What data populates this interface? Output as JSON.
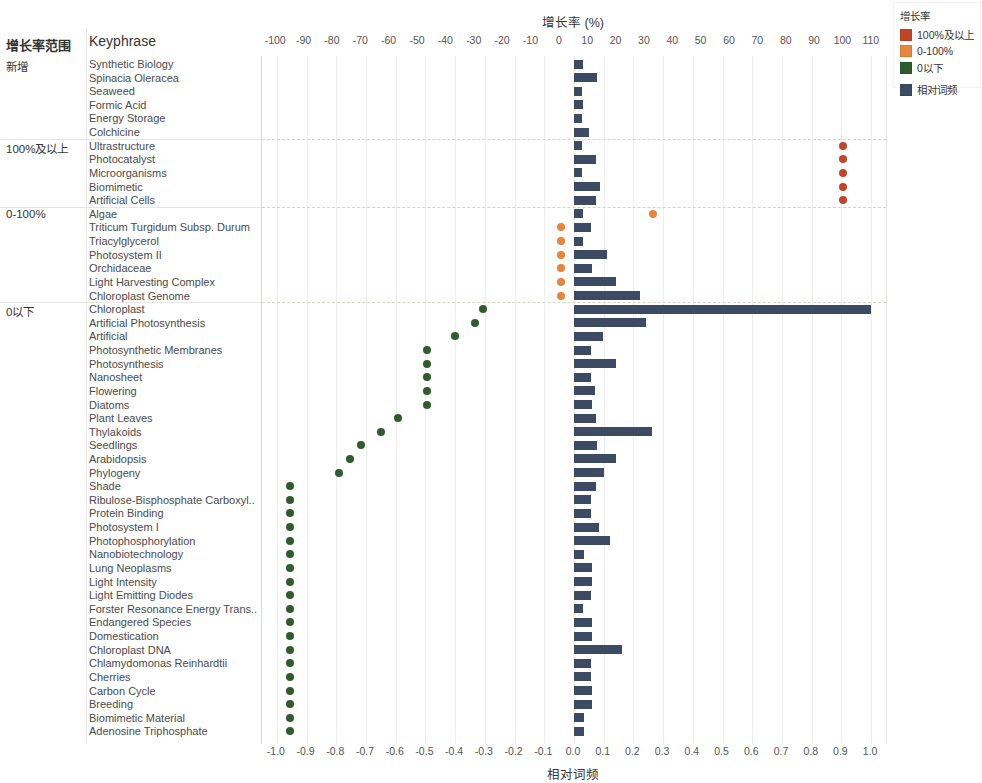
{
  "headers": {
    "range_col": "增长率范围",
    "keyphrase_col": "Keyphrase"
  },
  "legend": {
    "title": "增长率",
    "items": [
      {
        "label": "100%及以上",
        "color": "#c0462a"
      },
      {
        "label": "0-100%",
        "color": "#e8853c"
      },
      {
        "label": "0以下",
        "color": "#2f5c2c"
      },
      {
        "label": "相对词频",
        "color": "#3c4a63"
      }
    ]
  },
  "chart_data": {
    "type": "bar",
    "title": "增长率 (%)",
    "xlabel": "增长率 (%)",
    "xlabel_bottom": "相对词频",
    "ylabel": "Keyphrase",
    "grid": true,
    "legend_position": "top-right",
    "top_axis": {
      "label": "增长率 (%)",
      "ticks": [
        -100,
        -90,
        -80,
        -70,
        -60,
        -50,
        -40,
        -30,
        -20,
        -10,
        0,
        10,
        20,
        30,
        40,
        50,
        60,
        70,
        80,
        90,
        100,
        110
      ],
      "range": [
        -105,
        115
      ]
    },
    "bottom_axis": {
      "label": "相对词频",
      "ticks": [
        "-1.0",
        "-0.9",
        "-0.8",
        "-0.7",
        "-0.6",
        "-0.5",
        "-0.4",
        "-0.3",
        "-0.2",
        "-0.1",
        "0.0",
        "0.1",
        "0.2",
        "0.3",
        "0.4",
        "0.5",
        "0.6",
        "0.7",
        "0.8",
        "0.9",
        "1.0"
      ],
      "range": [
        -1.05,
        1.05
      ]
    },
    "series": [
      {
        "name": "相对词频",
        "type": "bar",
        "color": "#3c4a63"
      },
      {
        "name": "增长率",
        "type": "scatter",
        "colors": {
          "above100": "#c0462a",
          "zero_to_100": "#e8853c",
          "below0": "#2f5c2c"
        }
      }
    ],
    "groups": [
      {
        "label": "新增",
        "category": "new",
        "rows": [
          {
            "keyphrase": "Synthetic Biology",
            "freq": 0.03,
            "growth": null
          },
          {
            "keyphrase": "Spinacia Oleracea",
            "freq": 0.078,
            "growth": null
          },
          {
            "keyphrase": "Seaweed",
            "freq": 0.026,
            "growth": null
          },
          {
            "keyphrase": "Formic Acid",
            "freq": 0.031,
            "growth": null
          },
          {
            "keyphrase": "Energy Storage",
            "freq": 0.027,
            "growth": null
          },
          {
            "keyphrase": "Colchicine",
            "freq": 0.051,
            "growth": null
          }
        ]
      },
      {
        "label": "100%及以上",
        "category": "above100",
        "rows": [
          {
            "keyphrase": "Ultrastructure",
            "freq": 0.028,
            "growth": 100
          },
          {
            "keyphrase": "Photocatalyst",
            "freq": 0.074,
            "growth": 100
          },
          {
            "keyphrase": "Microorganisms",
            "freq": 0.026,
            "growth": 100
          },
          {
            "keyphrase": "Biomimetic",
            "freq": 0.086,
            "growth": 100
          },
          {
            "keyphrase": "Artificial Cells",
            "freq": 0.074,
            "growth": 100
          }
        ]
      },
      {
        "label": "0-100%",
        "category": "zero_to_100",
        "rows": [
          {
            "keyphrase": "Algae",
            "freq": 0.029,
            "growth": 33
          },
          {
            "keyphrase": "Triticum Turgidum Subsp. Durum",
            "freq": 0.057,
            "growth": 0.5
          },
          {
            "keyphrase": "Triacylglycerol",
            "freq": 0.031,
            "growth": 0.5
          },
          {
            "keyphrase": "Photosystem II",
            "freq": 0.111,
            "growth": 0.5
          },
          {
            "keyphrase": "Orchidaceae",
            "freq": 0.061,
            "growth": 0.5
          },
          {
            "keyphrase": "Light Harvesting Complex",
            "freq": 0.143,
            "growth": 0.5
          },
          {
            "keyphrase": "Chloroplast Genome",
            "freq": 0.222,
            "growth": 0.5
          }
        ]
      },
      {
        "label": "0以下",
        "category": "below0",
        "rows": [
          {
            "keyphrase": "Chloroplast",
            "freq": 1.0,
            "growth": -27
          },
          {
            "keyphrase": "Artificial Photosynthesis",
            "freq": 0.243,
            "growth": -30
          },
          {
            "keyphrase": "Artificial",
            "freq": 0.096,
            "growth": -37
          },
          {
            "keyphrase": "Photosynthetic Membranes",
            "freq": 0.058,
            "growth": -47
          },
          {
            "keyphrase": "Photosynthesis",
            "freq": 0.142,
            "growth": -47
          },
          {
            "keyphrase": "Nanosheet",
            "freq": 0.058,
            "growth": -47
          },
          {
            "keyphrase": "Flowering",
            "freq": 0.072,
            "growth": -47
          },
          {
            "keyphrase": "Diatoms",
            "freq": 0.06,
            "growth": -47
          },
          {
            "keyphrase": "Plant Leaves",
            "freq": 0.075,
            "growth": -57
          },
          {
            "keyphrase": "Thylakoids",
            "freq": 0.261,
            "growth": -63
          },
          {
            "keyphrase": "Seedlings",
            "freq": 0.076,
            "growth": -70
          },
          {
            "keyphrase": "Arabidopsis",
            "freq": 0.141,
            "growth": -74
          },
          {
            "keyphrase": "Phylogeny",
            "freq": 0.1,
            "growth": -78
          },
          {
            "keyphrase": "Shade",
            "freq": 0.075,
            "growth": -95
          },
          {
            "keyphrase": "Ribulose-Bisphosphate Carboxyl..",
            "freq": 0.057,
            "growth": -95
          },
          {
            "keyphrase": "Protein Binding",
            "freq": 0.057,
            "growth": -95
          },
          {
            "keyphrase": "Photosystem I",
            "freq": 0.083,
            "growth": -95
          },
          {
            "keyphrase": "Photophosphorylation",
            "freq": 0.122,
            "growth": -95
          },
          {
            "keyphrase": "Nanobiotechnology",
            "freq": 0.035,
            "growth": -95
          },
          {
            "keyphrase": "Lung Neoplasms",
            "freq": 0.06,
            "growth": -95
          },
          {
            "keyphrase": "Light Intensity",
            "freq": 0.06,
            "growth": -95
          },
          {
            "keyphrase": "Light Emitting Diodes",
            "freq": 0.056,
            "growth": -95
          },
          {
            "keyphrase": "Forster Resonance Energy Trans..",
            "freq": 0.031,
            "growth": -95
          },
          {
            "keyphrase": "Endangered Species",
            "freq": 0.06,
            "growth": -95
          },
          {
            "keyphrase": "Domestication",
            "freq": 0.06,
            "growth": -95
          },
          {
            "keyphrase": "Chloroplast DNA",
            "freq": 0.16,
            "growth": -95
          },
          {
            "keyphrase": "Chlamydomonas Reinhardtii",
            "freq": 0.057,
            "growth": -95
          },
          {
            "keyphrase": "Cherries",
            "freq": 0.057,
            "growth": -95
          },
          {
            "keyphrase": "Carbon Cycle",
            "freq": 0.06,
            "growth": -95
          },
          {
            "keyphrase": "Breeding",
            "freq": 0.06,
            "growth": -95
          },
          {
            "keyphrase": "Biomimetic Material",
            "freq": 0.032,
            "growth": -95
          },
          {
            "keyphrase": "Adenosine Triphosphate",
            "freq": 0.033,
            "growth": -95
          }
        ]
      }
    ]
  }
}
